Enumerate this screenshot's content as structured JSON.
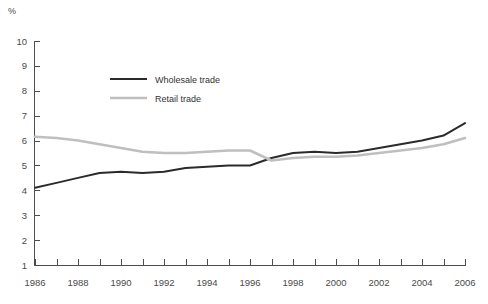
{
  "unit_label": "%",
  "legend": {
    "position": "inside-top-left",
    "entries": [
      {
        "label": "Wholesale trade",
        "color": "#2b2b2b",
        "width": 2.0
      },
      {
        "label": "Retail trade",
        "color": "#bfbfbf",
        "width": 2.6
      }
    ]
  },
  "axes": {
    "y_ticks": [
      "10",
      "9",
      "8",
      "7",
      "6",
      "5",
      "4",
      "3",
      "2",
      "1"
    ],
    "x_ticks": [
      "1986",
      "1988",
      "1990",
      "1992",
      "1994",
      "1996",
      "1998",
      "2000",
      "2002",
      "2004",
      "2006"
    ]
  },
  "chart_data": {
    "type": "line",
    "title": "",
    "subtitle": "",
    "xlabel": "",
    "ylabel": "%",
    "xlim": [
      1986,
      2006
    ],
    "ylim": [
      1,
      10
    ],
    "y_tick_values": [
      1,
      2,
      3,
      4,
      5,
      6,
      7,
      8,
      9,
      10
    ],
    "x_tick_values": [
      1986,
      1988,
      1990,
      1992,
      1994,
      1996,
      1998,
      2000,
      2002,
      2004,
      2006
    ],
    "x_minor_tick_interval": 1,
    "grid": false,
    "legend_position": "inside-top-left",
    "x": [
      1986,
      1987,
      1988,
      1989,
      1990,
      1991,
      1992,
      1993,
      1994,
      1995,
      1996,
      1997,
      1998,
      1999,
      2000,
      2001,
      2002,
      2003,
      2004,
      2005,
      2006
    ],
    "series": [
      {
        "name": "Wholesale trade",
        "color": "#2b2b2b",
        "values": [
          4.1,
          4.3,
          4.5,
          4.7,
          4.75,
          4.7,
          4.75,
          4.9,
          4.95,
          5.0,
          5.0,
          5.3,
          5.5,
          5.55,
          5.5,
          5.55,
          5.7,
          5.85,
          6.0,
          6.2,
          6.7
        ]
      },
      {
        "name": "Retail trade",
        "color": "#bfbfbf",
        "values": [
          6.15,
          6.1,
          6.0,
          5.85,
          5.7,
          5.55,
          5.5,
          5.5,
          5.55,
          5.6,
          5.6,
          5.2,
          5.3,
          5.35,
          5.35,
          5.4,
          5.5,
          5.6,
          5.7,
          5.85,
          6.1
        ]
      }
    ]
  }
}
